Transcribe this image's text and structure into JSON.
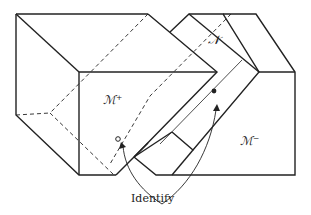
{
  "diagram": {
    "labels": {
      "m_plus": "ℳ⁺",
      "m_minus": "ℳ⁻",
      "n": "𝒩",
      "identify": "Identify"
    },
    "colors": {
      "stroke": "#222222",
      "background": "#ffffff"
    },
    "markers": {
      "open_point": "hollow circle on M+ side",
      "filled_point": "filled dot on N slab"
    }
  }
}
